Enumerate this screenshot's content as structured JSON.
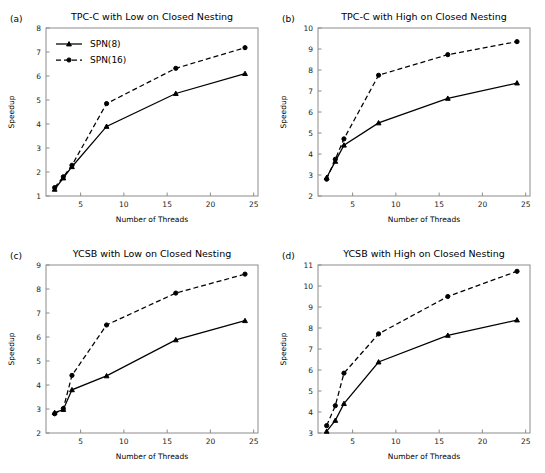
{
  "figure": {
    "name": "speedup-comparison-figure",
    "panel_count": 4
  },
  "series_names": {
    "solid": "SPN(8)",
    "dashed": "SPN(16)"
  },
  "axis_titles": {
    "x": "Number of Threads",
    "y": "Speedup"
  },
  "chart_data": [
    {
      "id": "panel-a",
      "type": "line",
      "panel_letter": "(a)",
      "title": "TPC-C with Low on Closed Nesting",
      "xlabel": "Number of Threads",
      "ylabel": "Speedup",
      "xlim": [
        1,
        25.5
      ],
      "ylim": [
        1,
        8
      ],
      "xticks": [
        5,
        10,
        15,
        20,
        25
      ],
      "yticks": [
        1,
        2,
        3,
        4,
        5,
        6,
        7,
        8
      ],
      "grid": false,
      "legend": "upper left",
      "x": [
        2,
        3,
        4,
        8,
        16,
        24
      ],
      "series": [
        {
          "name": "SPN(8)",
          "style": "solid",
          "marker": "triangle",
          "values": [
            1.28,
            1.75,
            2.22,
            3.9,
            5.27,
            6.1
          ]
        },
        {
          "name": "SPN(16)",
          "style": "dashed",
          "marker": "circle",
          "values": [
            1.35,
            1.8,
            2.28,
            4.85,
            6.32,
            7.18
          ]
        }
      ]
    },
    {
      "id": "panel-b",
      "type": "line",
      "panel_letter": "(b)",
      "title": "TPC-C with High on Closed Nesting",
      "xlabel": "Number of Threads",
      "ylabel": "Speedup",
      "xlim": [
        1,
        25.5
      ],
      "ylim": [
        2,
        10
      ],
      "xticks": [
        5,
        10,
        15,
        20,
        25
      ],
      "yticks": [
        2,
        3,
        4,
        5,
        6,
        7,
        8,
        9,
        10
      ],
      "grid": false,
      "legend": "none",
      "x": [
        2,
        3,
        4,
        8,
        16,
        24
      ],
      "series": [
        {
          "name": "SPN(8)",
          "style": "solid",
          "marker": "triangle",
          "values": [
            2.88,
            3.65,
            4.42,
            5.48,
            6.65,
            7.38
          ]
        },
        {
          "name": "SPN(16)",
          "style": "dashed",
          "marker": "circle",
          "values": [
            2.8,
            3.75,
            4.72,
            7.75,
            8.73,
            9.35
          ]
        }
      ]
    },
    {
      "id": "panel-c",
      "type": "line",
      "panel_letter": "(c)",
      "title": "YCSB with Low on Closed Nesting",
      "xlabel": "Number of Threads",
      "ylabel": "Speedup",
      "xlim": [
        1,
        25.5
      ],
      "ylim": [
        2,
        9
      ],
      "xticks": [
        5,
        10,
        15,
        20,
        25
      ],
      "yticks": [
        2,
        3,
        4,
        5,
        6,
        7,
        8,
        9
      ],
      "grid": false,
      "legend": "none",
      "x": [
        2,
        3,
        4,
        8,
        16,
        24
      ],
      "series": [
        {
          "name": "SPN(8)",
          "style": "solid",
          "marker": "triangle",
          "values": [
            2.85,
            2.98,
            3.8,
            4.38,
            5.88,
            6.68
          ]
        },
        {
          "name": "SPN(16)",
          "style": "dashed",
          "marker": "circle",
          "values": [
            2.8,
            3.02,
            4.4,
            6.5,
            7.83,
            8.62
          ]
        }
      ]
    },
    {
      "id": "panel-d",
      "type": "line",
      "panel_letter": "(d)",
      "title": "YCSB with High on Closed Nesting",
      "xlabel": "Number of Threads",
      "ylabel": "Speedup",
      "xlim": [
        1,
        25.5
      ],
      "ylim": [
        3,
        11
      ],
      "xticks": [
        5,
        10,
        15,
        20,
        25
      ],
      "yticks": [
        3,
        4,
        5,
        6,
        7,
        8,
        9,
        10,
        11
      ],
      "grid": false,
      "legend": "none",
      "x": [
        2,
        3,
        4,
        8,
        16,
        24
      ],
      "series": [
        {
          "name": "SPN(8)",
          "style": "solid",
          "marker": "triangle",
          "values": [
            3.08,
            3.6,
            4.4,
            6.38,
            7.65,
            8.38
          ]
        },
        {
          "name": "SPN(16)",
          "style": "dashed",
          "marker": "circle",
          "values": [
            3.35,
            4.3,
            5.85,
            7.72,
            9.5,
            10.7
          ]
        }
      ]
    }
  ]
}
